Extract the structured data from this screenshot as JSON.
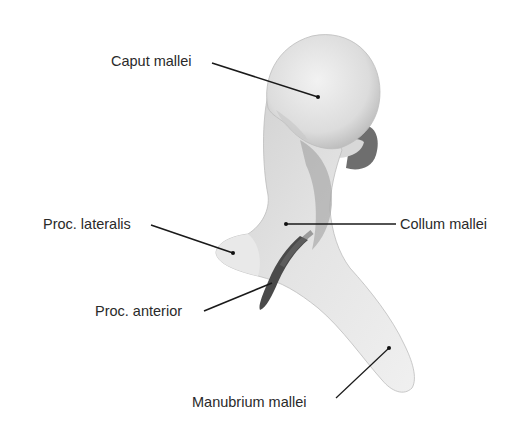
{
  "figure": {
    "labels": {
      "caput": "Caput mallei",
      "lateralis": "Proc. lateralis",
      "collum": "Collum mallei",
      "anterior": "Proc. anterior",
      "manubrium": "Manubrium mallei"
    },
    "colors": {
      "background": "#ffffff",
      "bone_light": "#ececec",
      "bone_mid": "#c9c9c9",
      "bone_dark": "#555555",
      "leader_line": "#1a1a1a",
      "text": "#2a2a2a"
    }
  }
}
